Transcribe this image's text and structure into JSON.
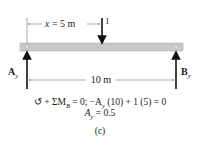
{
  "diagram": {
    "load_label": "1",
    "x_dim": {
      "var": "x",
      "eq": " = 5 m"
    },
    "span_dim": "10 m",
    "left_reaction": {
      "sym": "A",
      "sub": "y"
    },
    "right_reaction": {
      "sym": "B",
      "sub": "y"
    },
    "equation_line1": "↺ + ΣM",
    "equation_line1_sub": "B",
    "equation_line1_rest": " = 0; −A",
    "equation_line1_sub2": "y",
    "equation_line1_tail": " (10) + 1 (5) = 0",
    "equation_line2_sym": "A",
    "equation_line2_sub": "y",
    "equation_line2_rest": " = 0.5",
    "caption": "(c)",
    "colors": {
      "beam": "#c8c8c8",
      "beam_edge": "#a9a9a9",
      "ink": "#111111"
    }
  }
}
